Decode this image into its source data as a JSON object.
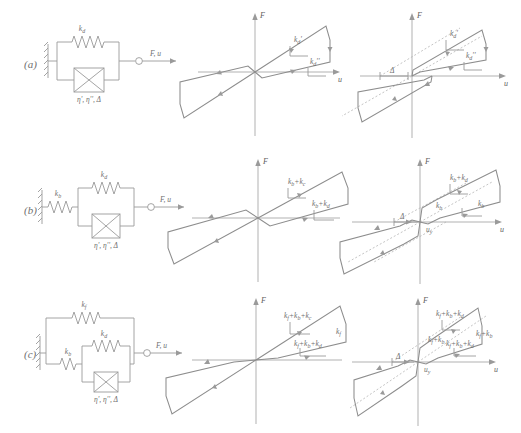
{
  "figure": {
    "caption_rows": [
      "(a)",
      "(b)",
      "(c)"
    ],
    "axis": {
      "force_label": "F",
      "displacement_label": "u"
    }
  },
  "rows": [
    {
      "id": "a",
      "label": "(a)",
      "model": {
        "springs": [
          {
            "name": "spring-kd",
            "label": "k",
            "sub": "d"
          }
        ],
        "dashpot": {
          "name": "dashpot-a",
          "label": "η', η'', Δ"
        },
        "output_label": "F, u",
        "series_spring": null
      },
      "mid_plot": {
        "name": "hysteresis-a-mid",
        "type": "leaf-loop",
        "slope_labels": [
          {
            "text": "k",
            "sub": "d",
            "prime": "'"
          },
          {
            "text": "k",
            "sub": "d",
            "prime": "''"
          }
        ],
        "x_label": "u",
        "y_label": "F"
      },
      "right_plot": {
        "name": "hysteresis-a-right",
        "type": "parallelogram-loop",
        "slope_labels": [
          {
            "text": "k",
            "sub": "d",
            "prime": "'"
          },
          {
            "text": "k",
            "sub": "d",
            "prime": "''"
          }
        ],
        "gap_label": "Δ",
        "x_label": "u",
        "y_label": "F"
      }
    },
    {
      "id": "b",
      "label": "(b)",
      "model": {
        "springs": [
          {
            "name": "spring-kd",
            "label": "k",
            "sub": "d"
          }
        ],
        "dashpot": {
          "name": "dashpot-b",
          "label": "η', η'', Δ"
        },
        "output_label": "F, u",
        "series_spring": {
          "name": "spring-kb",
          "label": "k",
          "sub": "b"
        }
      },
      "mid_plot": {
        "name": "hysteresis-b-mid",
        "type": "leaf-loop",
        "slope_labels": [
          {
            "text": "k",
            "sub": "b",
            "plus": "+",
            "text2": "k",
            "sub2": "c"
          },
          {
            "text": "k",
            "sub": "b",
            "plus": "+",
            "text2": "k",
            "sub2": "d"
          }
        ],
        "x_label": "u",
        "y_label": "F"
      },
      "right_plot": {
        "name": "hysteresis-b-right",
        "type": "parallelogram-loop",
        "slope_labels": [
          {
            "text": "k",
            "sub": "b",
            "plus": "+",
            "text2": "k",
            "sub2": "d"
          },
          {
            "text": "k",
            "sub": "b"
          },
          {
            "text": "k",
            "sub": "b"
          }
        ],
        "gap_label": "Δ",
        "yield_label": "u",
        "yield_sub": "y",
        "x_label": "u",
        "y_label": "F"
      }
    },
    {
      "id": "c",
      "label": "(c)",
      "model": {
        "springs": [
          {
            "name": "spring-kf",
            "label": "k",
            "sub": "f"
          },
          {
            "name": "spring-kd",
            "label": "k",
            "sub": "d"
          }
        ],
        "dashpot": {
          "name": "dashpot-c",
          "label": "η', η'', Δ"
        },
        "output_label": "F, u",
        "series_spring": {
          "name": "spring-kb",
          "label": "k",
          "sub": "b"
        }
      },
      "mid_plot": {
        "name": "hysteresis-c-mid",
        "type": "leaf-loop",
        "slope_labels": [
          {
            "text": "k",
            "sub": "f",
            "plus": "+",
            "text2": "k",
            "sub2": "b",
            "plus2": "+",
            "text3": "k",
            "sub3": "c"
          },
          {
            "text": "k",
            "sub": "f",
            "plus": "+",
            "text2": "k",
            "sub2": "b",
            "plus2": "+",
            "text3": "k",
            "sub3": "d"
          },
          {
            "text": "k",
            "sub": "f"
          }
        ],
        "x_label": "u",
        "y_label": "F"
      },
      "right_plot": {
        "name": "hysteresis-c-right",
        "type": "parallelogram-loop",
        "slope_labels": [
          {
            "text": "k",
            "sub": "f",
            "plus": "+",
            "text2": "k",
            "sub2": "b",
            "plus2": "+",
            "text3": "k",
            "sub3": "d"
          },
          {
            "text": "k",
            "sub": "f",
            "plus": "+",
            "text2": "k",
            "sub2": "b"
          },
          {
            "text": "k",
            "sub": "f",
            "plus": "+",
            "text2": "k",
            "sub2": "b"
          },
          {
            "text": "k",
            "sub": "f"
          }
        ],
        "gap_label": "Δ",
        "yield_label": "u",
        "yield_sub": "y",
        "x_label": "u",
        "y_label": "F"
      }
    }
  ],
  "colors": {
    "line": "#9a9a9a",
    "loop": "#8d8d8d",
    "axis": "#a8a8a8",
    "text": "#6f6f6f",
    "background": "#ffffff"
  }
}
